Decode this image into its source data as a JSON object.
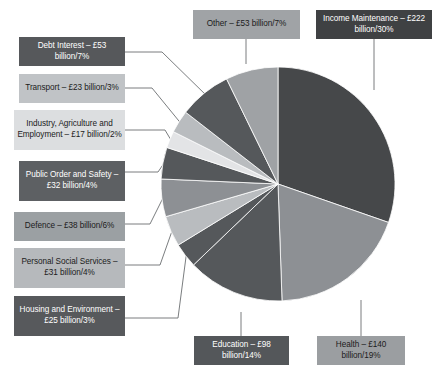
{
  "chart_data": {
    "type": "pie",
    "title": "",
    "legend_position": "callout-labels",
    "unit": "£ billion",
    "categories": [
      "Income Maintenance",
      "Health",
      "Education",
      "Housing and Environment",
      "Personal Social Services",
      "Defence",
      "Public Order and Safety",
      "Industry, Agriculture and Employment",
      "Transport",
      "Debt Interest",
      "Other"
    ],
    "values": [
      222,
      140,
      98,
      25,
      31,
      38,
      32,
      17,
      23,
      53,
      53
    ],
    "percents": [
      30,
      19,
      14,
      3,
      4,
      6,
      4,
      2,
      3,
      7,
      7
    ],
    "colors": [
      "#46484a",
      "#8d9094",
      "#55585b",
      "#55585b",
      "#b9bcbf",
      "#8d9094",
      "#55585b",
      "#e3e4e6",
      "#b9bcbf",
      "#55585b",
      "#9fa2a5"
    ]
  },
  "slices": [
    {
      "key": "income-maintenance",
      "name": "Income Maintenance",
      "value": 222,
      "percent": 30,
      "color": "#46484a",
      "label": "Income Maintenance – £222 billion/30%",
      "label_bg": "#3f4143",
      "label_fg": "#ffffff"
    },
    {
      "key": "health",
      "name": "Health",
      "value": 140,
      "percent": 19,
      "color": "#8d9094",
      "label": "Health – £140 billion/19%",
      "label_bg": "#9b9e a1",
      "label_fg": "#1b1b1b"
    },
    {
      "key": "education",
      "name": "Education",
      "value": 98,
      "percent": 14,
      "color": "#55585b",
      "label": "Education – £98 billion/14%",
      "label_bg": "#54575a",
      "label_fg": "#ffffff"
    },
    {
      "key": "housing-and-environment",
      "name": "Housing and Environment",
      "value": 25,
      "percent": 3,
      "color": "#55585b",
      "label": "Housing and Environment – £25 billion/3%",
      "label_bg": "#57595c",
      "label_fg": "#ffffff"
    },
    {
      "key": "personal-social-services",
      "name": "Personal Social Services",
      "value": 31,
      "percent": 4,
      "color": "#b9bcbf",
      "label": "Personal Social Services – £31 billion/4%",
      "label_bg": "#b6b9bc",
      "label_fg": "#1b1b1b"
    },
    {
      "key": "defence",
      "name": "Defence",
      "value": 38,
      "percent": 6,
      "color": "#8d9094",
      "label": "Defence – £38 billion/6%",
      "label_bg": "#9ba0a3",
      "label_fg": "#1b1b1b"
    },
    {
      "key": "public-order-and-safety",
      "name": "Public Order and Safety",
      "value": 32,
      "percent": 4,
      "color": "#55585b",
      "label": "Public Order and Safety – £32 billion/4%",
      "label_bg": "#5d6063",
      "label_fg": "#ffffff"
    },
    {
      "key": "industry-agriculture-and-employment",
      "name": "Industry, Agriculture and Employment",
      "value": 17,
      "percent": 2,
      "color": "#e3e4e6",
      "label": "Industry, Agriculture and Employment – £17 billion/2%",
      "label_bg": "#dcdee0",
      "label_fg": "#1b1b1b"
    },
    {
      "key": "transport",
      "name": "Transport",
      "value": 23,
      "percent": 3,
      "color": "#b9bcbf",
      "label": "Transport – £23 billion/3%",
      "label_bg": "#c0c3c6",
      "label_fg": "#1b1b1b"
    },
    {
      "key": "debt-interest",
      "name": "Debt Interest",
      "value": 53,
      "percent": 7,
      "color": "#55585b",
      "label": "Debt Interest – £53 billion/7%",
      "label_bg": "#56585b",
      "label_fg": "#ffffff"
    },
    {
      "key": "other",
      "name": "Other",
      "value": 53,
      "percent": 7,
      "color": "#9fa2a5",
      "label": "Other – £53 billion/7%",
      "label_bg": "#a0a3a6",
      "label_fg": "#1b1b1b"
    }
  ]
}
